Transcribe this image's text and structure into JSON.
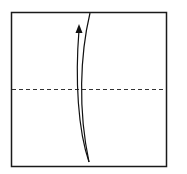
{
  "diagram": {
    "type": "origami-fold-step",
    "paper": {
      "x": 11,
      "y": 12,
      "width": 155,
      "height": 154,
      "stroke": "#1a1a1a",
      "fill": "#ffffff"
    },
    "fold_line": {
      "kind": "valley-fold",
      "style": "dashed",
      "y": 89,
      "x1": 11,
      "x2": 166,
      "stroke": "#333333"
    },
    "arrow": {
      "direction": "up",
      "meaning": "fold bottom half up to top edge",
      "stroke": "#111111"
    }
  }
}
